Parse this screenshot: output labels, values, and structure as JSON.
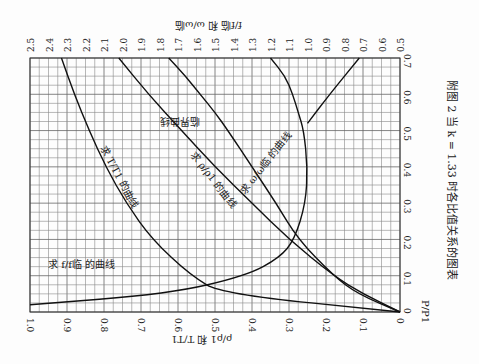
{
  "chart_data": {
    "type": "line",
    "title": "附图 2  当 k = 1.33 时各比值关系的图表",
    "orientation_note": "printed rotated 90°; x-axis P/P1 runs along the right edge",
    "xlabel": "P/P1",
    "x_ticks": [
      "0",
      "0.1",
      "0.2",
      "0.3",
      "0.4",
      "0.5",
      "0.6",
      "0.7"
    ],
    "xlim": [
      0,
      0.7
    ],
    "ylabel_left": "ρ/ρ1 和 T/T1",
    "y_left_ticks": [
      "1.0",
      "0.9",
      "0.8",
      "0.7",
      "0.6",
      "0.5",
      "0.4",
      "0.3",
      "0.2",
      "0.1",
      "0"
    ],
    "ylim_left": [
      0,
      1.0
    ],
    "ylabel_right": "f/f临 和 ω/ω临",
    "y_right_ticks": [
      "2.5",
      "2.4",
      "2.3",
      "2.2",
      "2.1",
      "2.0",
      "1.9",
      "1.8",
      "1.7",
      "1.6",
      "1.5",
      "1.4",
      "1.3",
      "1.2",
      "1.1",
      "1.0",
      "0.9",
      "0.8",
      "0.7",
      "0.6",
      "0.5"
    ],
    "ylim_right": [
      0.5,
      2.5
    ],
    "grid": true,
    "series": [
      {
        "name": "求 T/T1 的曲线",
        "axis": "left",
        "x": [
          0.0,
          0.05,
          0.1,
          0.2,
          0.3,
          0.4,
          0.5,
          0.6,
          0.7
        ],
        "y": [
          0.0,
          0.48,
          0.565,
          0.67,
          0.74,
          0.795,
          0.84,
          0.88,
          0.915
        ]
      },
      {
        "name": "求 ρ/ρ1 的曲线",
        "axis": "left",
        "x": [
          0.0,
          0.05,
          0.1,
          0.2,
          0.3,
          0.4,
          0.5,
          0.6,
          0.7
        ],
        "y": [
          0.0,
          0.1,
          0.18,
          0.3,
          0.4,
          0.5,
          0.59,
          0.68,
          0.76
        ]
      },
      {
        "name": "求 f/f临 的曲线",
        "axis": "right",
        "x": [
          0.02,
          0.05,
          0.1,
          0.15,
          0.2,
          0.3,
          0.4,
          0.5,
          0.55,
          0.6,
          0.65,
          0.7
        ],
        "y": [
          2.5,
          1.75,
          1.33,
          1.15,
          1.07,
          1.01,
          1.0,
          1.02,
          1.05,
          1.08,
          1.12,
          1.2
        ]
      },
      {
        "name": "求 ω/ω临 的曲线",
        "axis": "right",
        "x": [
          0.0,
          0.05,
          0.1,
          0.2,
          0.3,
          0.4,
          0.5,
          0.55,
          0.6,
          0.65,
          0.7
        ],
        "y": [
          0.5,
          0.73,
          0.86,
          1.05,
          1.17,
          1.3,
          1.43,
          1.5,
          1.58,
          1.66,
          1.75
        ]
      },
      {
        "name": "临界曲线",
        "axis": "right",
        "x": [
          0.52,
          0.6,
          0.7
        ],
        "y": [
          1.0,
          0.88,
          0.72
        ]
      }
    ],
    "annotations": [
      "求 T/T1 的曲线",
      "求 ρ/ρ1 的曲线",
      "求 ω/ω临 的曲线",
      "求 f/f临 的曲线",
      "临界曲线"
    ]
  },
  "labels": {
    "caption": "附图 2  当 k = 1.33 时各比值关系的图表",
    "x_axis": "P/P1",
    "left_axis": "ρ/ρ1 和 T/T1",
    "right_axis": "f/f临 和 ω/ω临",
    "curve_T": "求 T/T1 的曲线",
    "curve_rho": "求 ρ/ρ1 的曲线",
    "curve_omega": "求 ω/ω临 的曲线",
    "curve_f": "求 f/f临 的曲线",
    "curve_crit": "临界曲线"
  }
}
